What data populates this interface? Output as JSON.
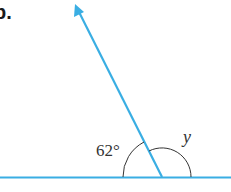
{
  "diagram": {
    "part_label": "b.",
    "angle_known": "62°",
    "angle_unknown": "y",
    "colors": {
      "line": "#3aaee3",
      "arc": "#333333",
      "text": "#333333"
    },
    "geometry": {
      "vertex": [
        162,
        177
      ],
      "ray_tip": [
        75,
        4
      ],
      "baseline_y": 177
    }
  }
}
